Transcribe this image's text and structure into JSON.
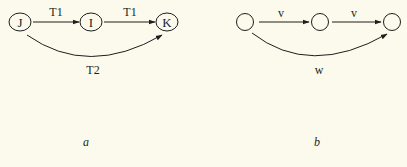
{
  "diagram_a": {
    "nodes": [
      {
        "id": "J",
        "label": "J"
      },
      {
        "id": "I",
        "label": "I"
      },
      {
        "id": "K",
        "label": "K"
      }
    ],
    "edges": [
      {
        "from": "J",
        "to": "I",
        "label": "T1"
      },
      {
        "from": "I",
        "to": "K",
        "label": "T1"
      },
      {
        "from": "J",
        "to": "K",
        "label": "T2",
        "curved": true
      }
    ],
    "caption": "a"
  },
  "diagram_b": {
    "nodes": [
      {
        "id": "n1",
        "label": ""
      },
      {
        "id": "n2",
        "label": ""
      },
      {
        "id": "n3",
        "label": ""
      }
    ],
    "edges": [
      {
        "from": "n1",
        "to": "n2",
        "label": "v"
      },
      {
        "from": "n2",
        "to": "n3",
        "label": "v"
      },
      {
        "from": "n1",
        "to": "n3",
        "label": "w",
        "curved": true
      }
    ],
    "caption": "b"
  },
  "colors": {
    "background": "#fbfaec",
    "ink": "#1e1e1e"
  }
}
